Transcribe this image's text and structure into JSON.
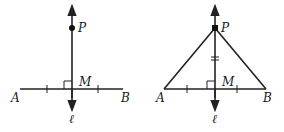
{
  "figures": [
    {
      "id": "perpendicular-bisector",
      "labels": {
        "P": "P",
        "M": "M",
        "A": "A",
        "B": "B",
        "line": "ℓ"
      },
      "points": {
        "P": [
          72,
          28
        ],
        "M": [
          72,
          89
        ],
        "A": [
          20,
          89
        ],
        "B": [
          123,
          89
        ]
      },
      "line_l": {
        "x": 72,
        "y_top": 8,
        "y_bottom": 108
      },
      "ticks_on_AB": [
        47,
        98
      ],
      "right_angle_marker": true
    },
    {
      "id": "isosceles-triangle",
      "labels": {
        "P": "P",
        "M": "M",
        "A": "A",
        "B": "B",
        "line": "ℓ"
      },
      "points": {
        "P": [
          215,
          28
        ],
        "M": [
          215,
          89
        ],
        "A": [
          164,
          89
        ],
        "B": [
          266,
          89
        ]
      },
      "line_l": {
        "x": 215,
        "y_top": 8,
        "y_bottom": 108
      },
      "ticks_on_AB": [
        187,
        237
      ],
      "double_tick_on_PM_y": 58,
      "right_angle_marker": true
    }
  ]
}
